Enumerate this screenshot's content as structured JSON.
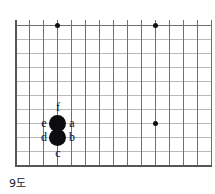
{
  "figure": {
    "caption": "9도",
    "kind": "go-board-diagram",
    "board": {
      "line_color": "#6e6e73",
      "faint_line_color": "#b9b9bc",
      "edge_color": "#55555a",
      "background": "#ffffff",
      "columns": 14,
      "rows": 11,
      "spacing_px": 14,
      "origin_x": 15,
      "origin_y": 25
    },
    "star_points": [
      {
        "name": "star-point-top-left",
        "col": 3,
        "row": 0
      },
      {
        "name": "star-point-top-right",
        "col": 10,
        "row": 0
      },
      {
        "name": "star-point-right",
        "col": 10,
        "row": 7
      }
    ],
    "stones": [
      {
        "name": "black-stone-upper",
        "color": "#0d0d0f",
        "col": 3,
        "row": 7
      },
      {
        "name": "black-stone-lower",
        "color": "#0d0d0f",
        "col": 3,
        "row": 8
      }
    ],
    "labels": [
      {
        "id": "a",
        "text": "a",
        "col": 4,
        "row": 7,
        "anchor": "right-of-upper-stone"
      },
      {
        "id": "b",
        "text": "b",
        "col": 4,
        "row": 8,
        "anchor": "right-of-lower-stone"
      },
      {
        "id": "c",
        "text": "c",
        "col": 3,
        "row": 9,
        "anchor": "below-lower-stone"
      },
      {
        "id": "d",
        "text": "d",
        "col": 2,
        "row": 8,
        "anchor": "left-of-lower-stone"
      },
      {
        "id": "e",
        "text": "e",
        "col": 2,
        "row": 7,
        "anchor": "left-of-upper-stone"
      },
      {
        "id": "f",
        "text": "f",
        "col": 3,
        "row": 6,
        "anchor": "above-upper-stone"
      }
    ]
  }
}
